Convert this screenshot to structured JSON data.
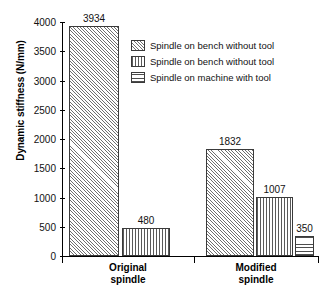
{
  "chart_data": {
    "type": "bar",
    "title": "",
    "xlabel": "",
    "ylabel": "Dynamic stiffness (N/mm)",
    "ylim": [
      0,
      4000
    ],
    "yticks": [
      0,
      500,
      1000,
      1500,
      2000,
      2500,
      3000,
      3500,
      4000
    ],
    "ytick_labels": [
      "0",
      "500",
      "1000",
      "1500",
      "2000",
      "2500",
      "3000",
      "3500",
      "4000"
    ],
    "grid": false,
    "legend_position": "upper right inside",
    "categories": [
      "Original spindle",
      "Modified spindle"
    ],
    "category_lines": [
      [
        "Original",
        "spindle"
      ],
      [
        "Modified",
        "spindle"
      ]
    ],
    "series": [
      {
        "name": "Spindle on bench without tool",
        "pattern": "diagonal-hatch",
        "values": [
          3934,
          1832
        ],
        "labels": [
          "3934",
          "1832"
        ]
      },
      {
        "name": "Spindle on bench without tool",
        "pattern": "vertical-hatch",
        "values": [
          480,
          1007
        ],
        "labels": [
          "480",
          "1007"
        ]
      },
      {
        "name": "Spindle on machine with tool",
        "pattern": "horizontal-hatch",
        "values": [
          null,
          350
        ],
        "labels": [
          "",
          "350"
        ]
      }
    ]
  },
  "legend": {
    "entries": [
      {
        "label": "Spindle on bench without tool",
        "pattern": "diagonal-hatch"
      },
      {
        "label": "Spindle on bench without tool",
        "pattern": "vertical-hatch"
      },
      {
        "label": "Spindle on machine with tool",
        "pattern": "horizontal-hatch"
      }
    ]
  },
  "colors": {
    "axis": "#000000",
    "bar_edge": "#3a3a3a",
    "bar_fill": "#ffffff",
    "text": "#111111"
  }
}
